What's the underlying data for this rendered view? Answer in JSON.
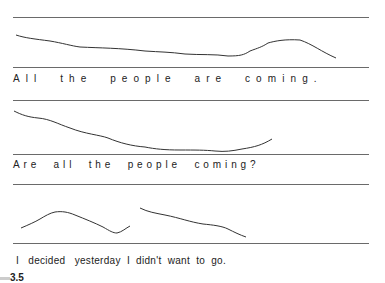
{
  "diagram": {
    "figure_label": "3.5",
    "examples": [
      {
        "id": "statement",
        "sentence": "All  the  people  are  coming."
      },
      {
        "id": "question",
        "sentence": "Are  all  the  people  coming?"
      },
      {
        "id": "ambiguous",
        "sentence": "I   decided   yesterday  I  didn't  want  to  go."
      }
    ],
    "line_color": "#6a6a6a",
    "contour_color": "#333333"
  }
}
